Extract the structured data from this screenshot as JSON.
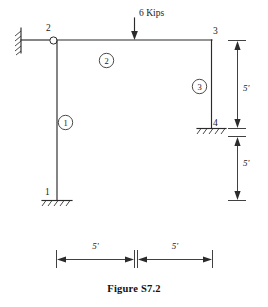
{
  "figure": {
    "caption": "Figure S7.2",
    "title": "Figure S7.2"
  },
  "load": {
    "label": "6 Kips",
    "magnitude": 6,
    "unit": "Kips",
    "direction": "down",
    "applied_at": "midspan of member 2"
  },
  "nodes": [
    {
      "id": "1",
      "label": "1",
      "support": "fixed-ground"
    },
    {
      "id": "2",
      "label": "2",
      "support": "fixed-wall-with-hinge"
    },
    {
      "id": "3",
      "label": "3",
      "support": "none"
    },
    {
      "id": "4",
      "label": "4",
      "support": "fixed-ground"
    }
  ],
  "members": [
    {
      "id": "1",
      "label": "1",
      "orientation": "vertical",
      "from": "2",
      "to": "1"
    },
    {
      "id": "2",
      "label": "2",
      "orientation": "horizontal",
      "from": "2",
      "to": "3"
    },
    {
      "id": "3",
      "label": "3",
      "orientation": "vertical",
      "from": "3",
      "to": "4"
    }
  ],
  "dimensions": {
    "horizontal": [
      {
        "label": "5'",
        "value": 5,
        "unit": "ft"
      },
      {
        "label": "5'",
        "value": 5,
        "unit": "ft"
      }
    ],
    "vertical": [
      {
        "label": "5'",
        "value": 5,
        "unit": "ft"
      },
      {
        "label": "5'",
        "value": 5,
        "unit": "ft"
      }
    ]
  },
  "colors": {
    "line": "#2b2b2b",
    "text": "#1a1a1a",
    "background": "#ffffff"
  }
}
